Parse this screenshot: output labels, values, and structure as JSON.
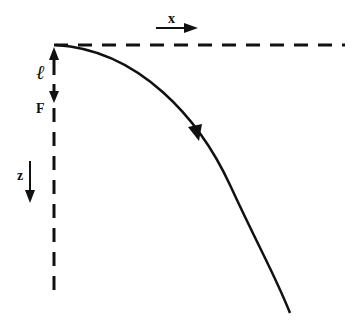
{
  "diagram": {
    "labels": {
      "x_axis": "x",
      "z_axis": "z",
      "length": "ℓ",
      "force": "F"
    },
    "colors": {
      "stroke": "#111111",
      "background": "#ffffff"
    },
    "elements": {
      "horizontal_reference": "dashed horizontal line from origin to the right",
      "vertical_reference": "dashed vertical line from origin downward",
      "trajectory": "solid curve from origin bending downward to the right with direction arrow"
    }
  }
}
